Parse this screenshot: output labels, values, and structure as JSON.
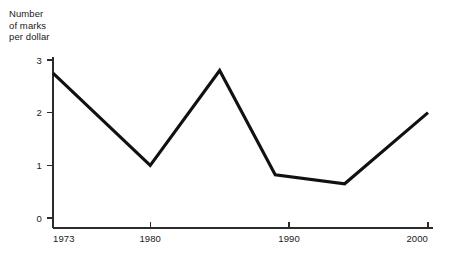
{
  "chart_data": {
    "type": "line",
    "title": "",
    "ylabel": "Number\nof marks\nper dollar",
    "xlabel": "",
    "ylim": [
      0,
      3
    ],
    "xlim": [
      1973,
      2000
    ],
    "yticks": [
      "0",
      "1",
      "2",
      "3"
    ],
    "ytick_values": [
      0,
      1,
      2,
      3
    ],
    "xticks": [
      "1973",
      "1980",
      "1990",
      "2000"
    ],
    "xtick_values": [
      1973,
      1980,
      1990,
      2000
    ],
    "grid": false,
    "legend": false,
    "line_color": "#111111",
    "axis_color": "#2b2b2b",
    "background_color": "#ffffff",
    "x": [
      1973,
      1980,
      1985,
      1989,
      1994,
      2000
    ],
    "values": [
      2.75,
      1.0,
      2.8,
      0.82,
      0.65,
      2.0
    ],
    "series": [
      {
        "name": "Number of marks per dollar",
        "x": [
          1973,
          1980,
          1985,
          1989,
          1994,
          2000
        ],
        "values": [
          2.75,
          1.0,
          2.8,
          0.82,
          0.65,
          2.0
        ]
      }
    ]
  }
}
